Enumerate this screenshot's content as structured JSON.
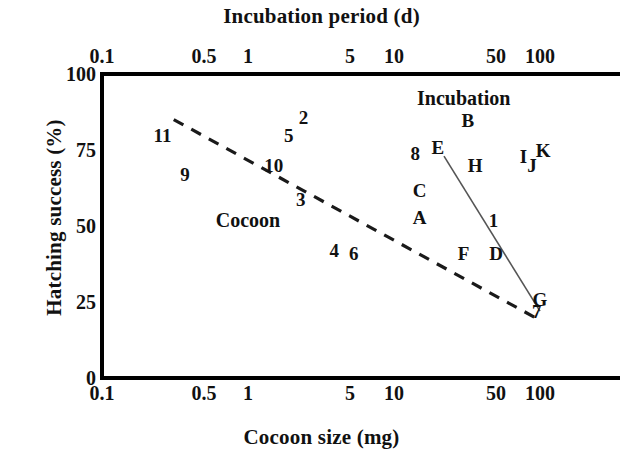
{
  "chart_data": {
    "type": "scatter",
    "title": "",
    "xlabel": "Cocoon size (mg)",
    "x2label": "Incubation period (d)",
    "ylabel": "Hatching success (%)",
    "xscale": "log",
    "x2scale": "log",
    "yscale": "linear",
    "xlim": [
      0.1,
      100
    ],
    "x2lim": [
      0.1,
      100
    ],
    "ylim": [
      0,
      100
    ],
    "grid": false,
    "legend": "none",
    "xticks": [
      "0.1",
      "0.5",
      "1",
      "5",
      "10",
      "50",
      "100"
    ],
    "xtick_values": [
      0.1,
      0.5,
      1,
      5,
      10,
      50,
      100
    ],
    "x2ticks": [
      "0.1",
      "0.5",
      "1",
      "5",
      "10",
      "50",
      "100"
    ],
    "x2tick_values": [
      0.1,
      0.5,
      1,
      5,
      10,
      50,
      100
    ],
    "yticks": [
      "0",
      "25",
      "50",
      "75",
      "100"
    ],
    "ytick_values": [
      0,
      25,
      50,
      75,
      100
    ],
    "annotations": [
      {
        "text": "Cocoon",
        "x": 1.0,
        "y": 52
      },
      {
        "text": "Incubation",
        "x": 30,
        "y": 92
      }
    ],
    "series": [
      {
        "name": "Cocoon size",
        "marker": "text-label",
        "axis": "bottom",
        "points": [
          {
            "label": "11",
            "x": 0.26,
            "y": 80
          },
          {
            "label": "9",
            "x": 0.37,
            "y": 67
          },
          {
            "label": "5",
            "x": 1.9,
            "y": 80
          },
          {
            "label": "2",
            "x": 2.4,
            "y": 86
          },
          {
            "label": "10",
            "x": 1.5,
            "y": 70
          },
          {
            "label": "3",
            "x": 2.3,
            "y": 59
          },
          {
            "label": "4",
            "x": 3.9,
            "y": 42
          },
          {
            "label": "6",
            "x": 5.3,
            "y": 41
          },
          {
            "label": "8",
            "x": 14,
            "y": 74
          },
          {
            "label": "1",
            "x": 48,
            "y": 52
          },
          {
            "label": "7",
            "x": 95,
            "y": 22
          }
        ]
      },
      {
        "name": "Incubation period",
        "marker": "text-label",
        "axis": "top",
        "points": [
          {
            "label": "A",
            "x": 15,
            "y": 53
          },
          {
            "label": "B",
            "x": 32,
            "y": 85
          },
          {
            "label": "C",
            "x": 15,
            "y": 62
          },
          {
            "label": "D",
            "x": 50,
            "y": 41
          },
          {
            "label": "E",
            "x": 20,
            "y": 76
          },
          {
            "label": "F",
            "x": 30,
            "y": 41
          },
          {
            "label": "G",
            "x": 100,
            "y": 26
          },
          {
            "label": "H",
            "x": 36,
            "y": 70
          },
          {
            "label": "I",
            "x": 77,
            "y": 73
          },
          {
            "label": "J",
            "x": 88,
            "y": 70
          },
          {
            "label": "K",
            "x": 105,
            "y": 75
          }
        ]
      }
    ],
    "trend_lines": [
      {
        "name": "cocoon-regression",
        "style": "dashed",
        "axis": "bottom",
        "x_start": 0.31,
        "y_start": 85,
        "x_end": 100,
        "y_end": 19
      },
      {
        "name": "incubation-regression",
        "style": "solid",
        "axis": "top",
        "x_start": 22,
        "y_start": 73,
        "x_end": 100,
        "y_end": 22
      }
    ]
  },
  "axes": {
    "top_title": "Incubation period (d)",
    "bottom_title": "Cocoon size (mg)",
    "y_title": "Hatching success (%)"
  },
  "colors": {
    "foreground": "#111111",
    "background": "#ffffff",
    "dashed_line": "#1a1a1a",
    "solid_line": "#555555"
  }
}
